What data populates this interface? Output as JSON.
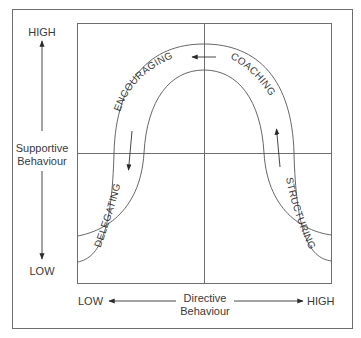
{
  "diagram": {
    "type": "leadership-styles-curve",
    "y_axis": {
      "label_line1": "Supportive",
      "label_line2": "Behaviour",
      "high": "HIGH",
      "low": "LOW"
    },
    "x_axis": {
      "label_line1": "Directive",
      "label_line2": "Behaviour",
      "low": "LOW",
      "high": "HIGH"
    },
    "styles": [
      {
        "name": "DELEGATING",
        "quadrant": "low-supportive / low-directive"
      },
      {
        "name": "ENCOURAGING",
        "quadrant": "high-supportive / low-directive"
      },
      {
        "name": "COACHING",
        "quadrant": "high-supportive / high-directive"
      },
      {
        "name": "STRUCTURING",
        "quadrant": "low-supportive / high-directive"
      }
    ],
    "flow_direction": "STRUCTURING → COACHING → ENCOURAGING → DELEGATING",
    "colors": {
      "line": "#6e6e6e",
      "text": "#3a3a3a",
      "background": "#ffffff"
    }
  }
}
